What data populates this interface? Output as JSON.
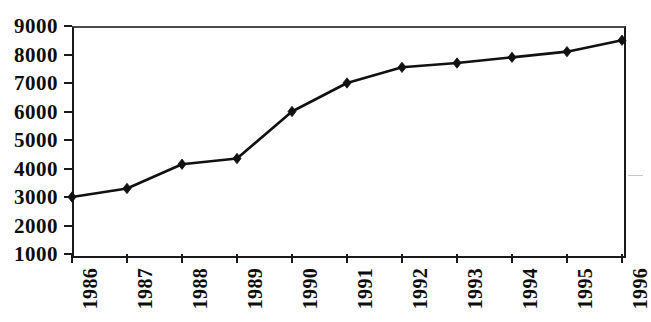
{
  "chart_data": {
    "type": "line",
    "title": "",
    "subtitle": "",
    "xlabel": "",
    "ylabel": "",
    "categories": [
      "1986",
      "1987",
      "1988",
      "1989",
      "1990",
      "1991",
      "1992",
      "1993",
      "1994",
      "1995",
      "1996"
    ],
    "values": [
      3000,
      3300,
      4150,
      4350,
      6000,
      7000,
      7550,
      7700,
      7900,
      8100,
      8500
    ],
    "series": [
      {
        "name": "",
        "values": [
          3000,
          3300,
          4150,
          4350,
          6000,
          7000,
          7550,
          7700,
          7900,
          8100,
          8500
        ]
      }
    ],
    "ylim": [
      1000,
      9000
    ],
    "ytick_labels": [
      "9000",
      "8000",
      "7000",
      "6000",
      "5000",
      "4000",
      "3000",
      "2000",
      "1000"
    ],
    "ytick_values": [
      9000,
      8000,
      7000,
      6000,
      5000,
      4000,
      3000,
      2000,
      1000
    ],
    "xtick_labels": [
      "1986",
      "1987",
      "1988",
      "1989",
      "1990",
      "1991",
      "1992",
      "1993",
      "1994",
      "1995",
      "1996"
    ],
    "grid": false,
    "legend": false,
    "legend_position": "none",
    "marker": "diamond",
    "line_color": "#111111",
    "marker_color": "#111111",
    "axis_color": "#1a1a1a",
    "background_color": "#ffffff",
    "x_label_rotation": -90,
    "annotations": []
  }
}
